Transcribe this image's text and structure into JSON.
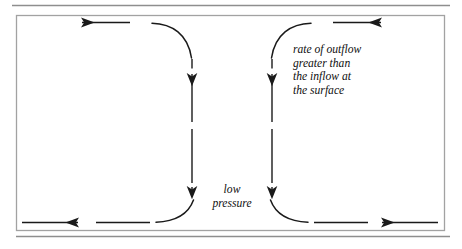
{
  "figure": {
    "kind": "meteorological-circulation-diagram",
    "width": 462,
    "height": 249,
    "background_color": "#ffffff",
    "ink_color": "#1a1a1a",
    "frame": {
      "border_color": "#9a9a9a",
      "top_rule_present": true,
      "bottom_rule_present": true
    }
  },
  "annotations": {
    "outflow": {
      "line1": "rate of outflow",
      "line2": "greater than",
      "line3": "the inflow at",
      "line4": "the surface"
    },
    "low_pressure": {
      "line1": "low",
      "line2": "pressure"
    }
  },
  "flow_arrows": [
    {
      "name": "top-left-outflow",
      "direction": "left",
      "position": "top",
      "label": ""
    },
    {
      "name": "top-right-outflow",
      "direction": "right",
      "position": "top",
      "label": ""
    },
    {
      "name": "bottom-left-inflow",
      "direction": "right",
      "position": "bottom",
      "label": ""
    },
    {
      "name": "bottom-right-inflow",
      "direction": "left",
      "position": "bottom",
      "label": ""
    },
    {
      "name": "left-ascent-lower",
      "direction": "up",
      "position": "center-left",
      "label": ""
    },
    {
      "name": "left-ascent-upper",
      "direction": "up",
      "position": "center-left",
      "label": ""
    },
    {
      "name": "right-ascent-lower",
      "direction": "up",
      "position": "center-right",
      "label": ""
    },
    {
      "name": "right-ascent-upper",
      "direction": "up",
      "position": "center-right",
      "label": ""
    }
  ]
}
